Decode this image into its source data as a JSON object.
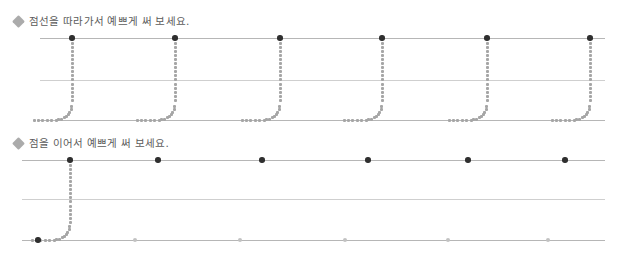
{
  "page": {
    "width": 617,
    "height": 258,
    "background": "#ffffff"
  },
  "colors": {
    "rule_line": "#b6b6b6",
    "rule_line_faint": "#cfcfcf",
    "trace_dot": "#a6a6a6",
    "anchor_dot": "#2f2f2f",
    "anchor_dot_faint": "#c2c2c2",
    "heading_text": "#4a4a4a",
    "bullet": "#9c9c9c"
  },
  "sections": [
    {
      "id": "trace-section",
      "bullet_icon": "diamond-bullet-icon",
      "heading": "점선을 따라가서 예쁘게 써 보세요.",
      "staff": {
        "top": 38,
        "middle": 80,
        "baseline": 120,
        "line_left": 40,
        "line_right": 605
      },
      "glyph_shape": "j-curve",
      "glyph_mode": "full-dotted-trace",
      "glyph_x_positions": [
        72,
        175,
        280,
        382,
        487,
        590
      ],
      "anchor_top": true,
      "anchor_bottom": false
    },
    {
      "id": "connect-section",
      "bullet_icon": "diamond-bullet-icon",
      "heading": "점을 이어서 예쁘게 써 보세요.",
      "staff": {
        "top": 160,
        "middle": 199,
        "baseline": 240,
        "line_left": 22,
        "line_right": 605
      },
      "glyph_shape": "j-curve",
      "glyph_mode": "first-dotted-rest-endpoints",
      "glyph_x_positions": [
        70,
        158,
        262,
        368,
        468,
        565
      ],
      "baseline_dot_x_positions": [
        38,
        135,
        240,
        345,
        448,
        548
      ],
      "anchor_top": true,
      "anchor_bottom": true
    }
  ],
  "headings": {
    "trace_instruction": "점선을 따라가서 예쁘게 써 보세요.",
    "connect_instruction": "점을 이어서 예쁘게 써 보세요."
  },
  "heading_positions": [
    {
      "left": 14,
      "top": 16
    },
    {
      "left": 14,
      "top": 138
    }
  ]
}
